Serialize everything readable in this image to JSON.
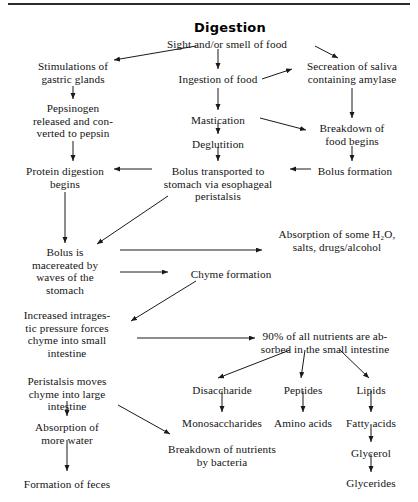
{
  "document": {
    "title": "Digestion",
    "type": "flowchart",
    "top_rule": true,
    "ink_color": "#141414",
    "background_color": "#ffffff"
  },
  "nodes": [
    {
      "id": "title",
      "label": "Digestion",
      "x": 230,
      "y": 20,
      "w": 0,
      "align": "center",
      "style": "title"
    },
    {
      "id": "sight",
      "label": "Sight and/or smell of food",
      "x": 227,
      "y": 38,
      "w": 160,
      "align": "center",
      "style": "body"
    },
    {
      "id": "stimulations",
      "label": "Stimulations of\ngastric glands",
      "x": 73,
      "y": 60,
      "w": 120,
      "align": "center",
      "style": "body"
    },
    {
      "id": "ingestion",
      "label": "Ingestion of food",
      "x": 218,
      "y": 73,
      "w": 110,
      "align": "center",
      "style": "body"
    },
    {
      "id": "secreation",
      "label": "Secreation of saliva\ncontaining amylase",
      "x": 352,
      "y": 60,
      "w": 128,
      "align": "center",
      "style": "body"
    },
    {
      "id": "pepsinogen",
      "label": "Pepsinogen\nreleased and con-\nverted to pepsin",
      "x": 73,
      "y": 102,
      "w": 120,
      "align": "center",
      "style": "body"
    },
    {
      "id": "mastication",
      "label": "Mastication",
      "x": 218,
      "y": 114,
      "w": 100,
      "align": "center",
      "style": "body"
    },
    {
      "id": "deglutition",
      "label": "Deglutition",
      "x": 218,
      "y": 138,
      "w": 100,
      "align": "center",
      "style": "body"
    },
    {
      "id": "breakdown_food",
      "label": "Breakdown of\nfood begins",
      "x": 352,
      "y": 122,
      "w": 110,
      "align": "center",
      "style": "body"
    },
    {
      "id": "protein_digest",
      "label": "Protein digestion\nbegins",
      "x": 65,
      "y": 165,
      "w": 120,
      "align": "center",
      "style": "body"
    },
    {
      "id": "bolus_transport",
      "label": "Bolus transported to\nstomach via esophageal\nperistalsis",
      "x": 218,
      "y": 165,
      "w": 140,
      "align": "center",
      "style": "body"
    },
    {
      "id": "bolus_formation",
      "label": "Bolus formation",
      "x": 355,
      "y": 165,
      "w": 110,
      "align": "center",
      "style": "body"
    },
    {
      "id": "bolus_macerated",
      "label": "Bolus is\nmacereated by\nwaves of the\nstomach",
      "x": 65,
      "y": 246,
      "w": 110,
      "align": "center",
      "style": "body"
    },
    {
      "id": "absorption_h2o",
      "label": "Absorption of some H₂O,\nsalts, drugs/alcohol",
      "x": 337,
      "y": 228,
      "w": 160,
      "align": "center",
      "style": "body"
    },
    {
      "id": "chyme_formation",
      "label": "Chyme formation",
      "x": 231,
      "y": 268,
      "w": 116,
      "align": "center",
      "style": "body"
    },
    {
      "id": "increased_press",
      "label": "Increased intrages-\ntic pressure forces\nchyme into small\nintestine",
      "x": 67,
      "y": 309,
      "w": 125,
      "align": "center",
      "style": "body"
    },
    {
      "id": "ninety_percent",
      "label": "90% of all nutrients are ab-\nsorbed in the small intestine",
      "x": 325,
      "y": 330,
      "w": 185,
      "align": "center",
      "style": "body"
    },
    {
      "id": "peristalsis_moves",
      "label": "Peristalsis moves\nchyme into large\nintestine",
      "x": 67,
      "y": 375,
      "w": 125,
      "align": "center",
      "style": "body"
    },
    {
      "id": "disaccharide",
      "label": "Disaccharide",
      "x": 222,
      "y": 384,
      "w": 100,
      "align": "center",
      "style": "body"
    },
    {
      "id": "peptides",
      "label": "Peptides",
      "x": 303,
      "y": 384,
      "w": 72,
      "align": "center",
      "style": "body"
    },
    {
      "id": "lipids",
      "label": "Lipids",
      "x": 371,
      "y": 384,
      "w": 62,
      "align": "center",
      "style": "body"
    },
    {
      "id": "absorption_water",
      "label": "Absorption of\nmore water",
      "x": 67,
      "y": 421,
      "w": 110,
      "align": "center",
      "style": "body"
    },
    {
      "id": "monosaccharides",
      "label": "Monosaccharides",
      "x": 222,
      "y": 417,
      "w": 116,
      "align": "center",
      "style": "body"
    },
    {
      "id": "amino_acids",
      "label": "Amino acids",
      "x": 303,
      "y": 417,
      "w": 88,
      "align": "center",
      "style": "body"
    },
    {
      "id": "fatty_acids",
      "label": "Fatty acids",
      "x": 371,
      "y": 417,
      "w": 82,
      "align": "center",
      "style": "body"
    },
    {
      "id": "breakdown_bact",
      "label": "Breakdown of nutrients\nby bacteria",
      "x": 222,
      "y": 443,
      "w": 160,
      "align": "center",
      "style": "body"
    },
    {
      "id": "glycerol",
      "label": "Glycerol",
      "x": 371,
      "y": 447,
      "w": 76,
      "align": "center",
      "style": "body"
    },
    {
      "id": "formation_feces",
      "label": "Formation of feces",
      "x": 67,
      "y": 478,
      "w": 130,
      "align": "center",
      "style": "body"
    },
    {
      "id": "glycerides",
      "label": "Glycerides",
      "x": 371,
      "y": 477,
      "w": 84,
      "align": "center",
      "style": "body"
    }
  ],
  "edges": [
    {
      "id": "e-sight-stimulations",
      "from": "sight",
      "to": "stimulations",
      "x1": 196,
      "y1": 46,
      "x2": 114,
      "y2": 60
    },
    {
      "id": "e-sight-ingestion",
      "from": "sight",
      "to": "ingestion",
      "x1": 218,
      "y1": 49,
      "x2": 218,
      "y2": 69
    },
    {
      "id": "e-sight-secreation",
      "from": "sight",
      "to": "secreation",
      "x1": 315,
      "y1": 46,
      "x2": 338,
      "y2": 58
    },
    {
      "id": "e-ingestion-secreation",
      "from": "ingestion",
      "to": "secreation",
      "x1": 262,
      "y1": 79,
      "x2": 292,
      "y2": 69
    },
    {
      "id": "e-stimulations-pepsinogen",
      "from": "stimulations",
      "to": "pepsinogen",
      "x1": 73,
      "y1": 86,
      "x2": 73,
      "y2": 99
    },
    {
      "id": "e-ingestion-mastication",
      "from": "ingestion",
      "to": "mastication",
      "x1": 218,
      "y1": 88,
      "x2": 218,
      "y2": 110
    },
    {
      "id": "e-secreation-breakdown",
      "from": "secreation",
      "to": "breakdown_food",
      "x1": 352,
      "y1": 88,
      "x2": 352,
      "y2": 118
    },
    {
      "id": "e-mastication-breakdown",
      "from": "mastication",
      "to": "breakdown_food",
      "x1": 260,
      "y1": 118,
      "x2": 306,
      "y2": 130
    },
    {
      "id": "e-pepsinogen-protein",
      "from": "pepsinogen",
      "to": "protein_digest",
      "x1": 73,
      "y1": 141,
      "x2": 73,
      "y2": 161
    },
    {
      "id": "e-mastication-deglutition",
      "from": "mastication",
      "to": "deglutition",
      "x1": 218,
      "y1": 123,
      "x2": 218,
      "y2": 134
    },
    {
      "id": "e-deglutition-bolus",
      "from": "deglutition",
      "to": "bolus_transport",
      "x1": 218,
      "y1": 147,
      "x2": 218,
      "y2": 161
    },
    {
      "id": "e-bolusform-transport",
      "from": "bolus_formation",
      "to": "bolus_transport",
      "x1": 311,
      "y1": 169,
      "x2": 290,
      "y2": 169
    },
    {
      "id": "e-breakdown-bolusform",
      "from": "breakdown_food",
      "to": "bolus_formation",
      "x1": 352,
      "y1": 146,
      "x2": 352,
      "y2": 161
    },
    {
      "id": "e-transport-protein",
      "from": "bolus_transport",
      "to": "protein_digest",
      "x1": 152,
      "y1": 169,
      "x2": 114,
      "y2": 169
    },
    {
      "id": "e-protein-bolusmac",
      "from": "protein_digest",
      "to": "bolus_macerated",
      "x1": 65,
      "y1": 192,
      "x2": 65,
      "y2": 243
    },
    {
      "id": "e-transport-bolusmac",
      "from": "bolus_transport",
      "to": "bolus_macerated",
      "x1": 168,
      "y1": 196,
      "x2": 97,
      "y2": 244
    },
    {
      "id": "e-bolusmac-absorbh2o",
      "from": "bolus_macerated",
      "to": "absorption_h2o",
      "x1": 120,
      "y1": 250,
      "x2": 262,
      "y2": 250
    },
    {
      "id": "e-bolusmac-chyme",
      "from": "bolus_macerated",
      "to": "chyme_formation",
      "x1": 120,
      "y1": 272,
      "x2": 168,
      "y2": 272
    },
    {
      "id": "e-chyme-increased",
      "from": "chyme_formation",
      "to": "increased_press",
      "x1": 196,
      "y1": 281,
      "x2": 131,
      "y2": 321
    },
    {
      "id": "e-increased-ninety",
      "from": "increased_press",
      "to": "ninety_percent",
      "x1": 137,
      "y1": 338,
      "x2": 255,
      "y2": 338
    },
    {
      "id": "e-ninety-disaccharide",
      "from": "ninety_percent",
      "to": "disaccharide",
      "x1": 290,
      "y1": 350,
      "x2": 218,
      "y2": 378
    },
    {
      "id": "e-ninety-peptides",
      "from": "ninety_percent",
      "to": "peptides",
      "x1": 305,
      "y1": 350,
      "x2": 301,
      "y2": 378
    },
    {
      "id": "e-ninety-lipids",
      "from": "ninety_percent",
      "to": "lipids",
      "x1": 340,
      "y1": 350,
      "x2": 369,
      "y2": 378
    },
    {
      "id": "e-peristalsis-absorbwater",
      "from": "peristalsis_moves",
      "to": "absorption_water",
      "x1": 67,
      "y1": 401,
      "x2": 67,
      "y2": 416
    },
    {
      "id": "e-peristalsis-breakdownbact",
      "from": "peristalsis_moves",
      "to": "breakdown_bact",
      "x1": 118,
      "y1": 405,
      "x2": 170,
      "y2": 434
    },
    {
      "id": "e-disaccharide-mono",
      "from": "disaccharide",
      "to": "monosaccharides",
      "x1": 222,
      "y1": 391,
      "x2": 222,
      "y2": 412
    },
    {
      "id": "e-peptides-amino",
      "from": "peptides",
      "to": "amino_acids",
      "x1": 303,
      "y1": 391,
      "x2": 303,
      "y2": 412
    },
    {
      "id": "e-lipids-fatty",
      "from": "lipids",
      "to": "fatty_acids",
      "x1": 371,
      "y1": 391,
      "x2": 371,
      "y2": 412
    },
    {
      "id": "e-absorbwater-feces",
      "from": "absorption_water",
      "to": "formation_feces",
      "x1": 67,
      "y1": 440,
      "x2": 67,
      "y2": 471
    },
    {
      "id": "e-fatty-glycerol",
      "from": "fatty_acids",
      "to": "glycerol",
      "x1": 371,
      "y1": 424,
      "x2": 371,
      "y2": 442
    },
    {
      "id": "e-glycerol-glycerides",
      "from": "glycerol",
      "to": "glycerides",
      "x1": 371,
      "y1": 454,
      "x2": 371,
      "y2": 472
    }
  ]
}
